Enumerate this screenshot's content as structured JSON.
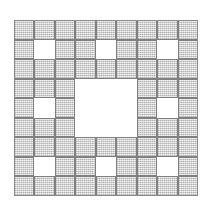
{
  "figure": {
    "background_color": "#ffffff"
  },
  "chart_data": {
    "type": "heatmap",
    "subtitle": "",
    "xlabel": "",
    "ylabel": "",
    "legend": [],
    "annotations": [],
    "grid": true,
    "iteration": 2,
    "base": 3,
    "rows": 9,
    "cols": 9,
    "x": [
      0,
      1,
      2,
      3,
      4,
      5,
      6,
      7,
      8
    ],
    "y": [
      0,
      1,
      2,
      3,
      4,
      5,
      6,
      7,
      8
    ],
    "xlim": [
      0,
      9
    ],
    "ylim": [
      0,
      9
    ],
    "value_labels": {
      "1": "filled",
      "0": "hole"
    },
    "colors": {
      "filled": "#c9c9c9",
      "hole": "#ffffff",
      "gridline": "#808080",
      "frame": "#8a8a8a",
      "background": "#ffffff"
    },
    "filled_cell_count": 64,
    "hole_cell_count": 17,
    "values": [
      [
        1,
        1,
        1,
        1,
        1,
        1,
        1,
        1,
        1
      ],
      [
        1,
        0,
        1,
        1,
        0,
        1,
        1,
        0,
        1
      ],
      [
        1,
        1,
        1,
        1,
        1,
        1,
        1,
        1,
        1
      ],
      [
        1,
        1,
        1,
        0,
        0,
        0,
        1,
        1,
        1
      ],
      [
        1,
        0,
        1,
        0,
        0,
        0,
        1,
        0,
        1
      ],
      [
        1,
        1,
        1,
        0,
        0,
        0,
        1,
        1,
        1
      ],
      [
        1,
        1,
        1,
        1,
        1,
        1,
        1,
        1,
        1
      ],
      [
        1,
        0,
        1,
        1,
        0,
        1,
        1,
        0,
        1
      ],
      [
        1,
        1,
        1,
        1,
        1,
        1,
        1,
        1,
        1
      ]
    ]
  },
  "geometry": {
    "plate_left": 14,
    "plate_top": 20,
    "plate_width": 184,
    "plate_height": 176
  }
}
